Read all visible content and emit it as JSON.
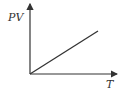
{
  "chart_data": {
    "type": "line",
    "title": "",
    "xlabel": "T",
    "ylabel": "PV",
    "series": [
      {
        "name": "PV vs T",
        "x": [
          0,
          1
        ],
        "y": [
          0,
          1
        ]
      }
    ],
    "proportional": true,
    "origin_passing": true,
    "grid": false,
    "ticks": false
  }
}
